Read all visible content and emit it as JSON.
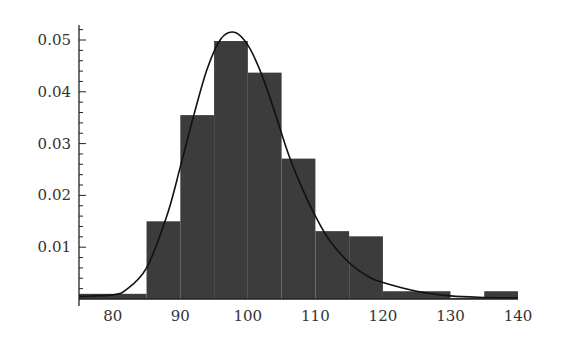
{
  "chart_data": {
    "type": "bar",
    "subtype": "histogram-with-density-curve",
    "title": "",
    "xlabel": "",
    "ylabel": "",
    "xlim": [
      75,
      140
    ],
    "ylim": [
      0,
      0.052
    ],
    "x_ticks": [
      80,
      90,
      100,
      110,
      120,
      130,
      140
    ],
    "x_tick_labels": [
      "80",
      "90",
      "100",
      "110",
      "120",
      "130",
      "140"
    ],
    "y_ticks": [
      0.01,
      0.02,
      0.03,
      0.04,
      0.05
    ],
    "y_tick_labels": [
      "0.01",
      "0.02",
      "0.03",
      "0.04",
      "0.05"
    ],
    "grid": false,
    "legend": null,
    "bins": [
      {
        "from": 75,
        "to": 85,
        "density": 0.001
      },
      {
        "from": 85,
        "to": 90,
        "density": 0.015
      },
      {
        "from": 90,
        "to": 95,
        "density": 0.0355
      },
      {
        "from": 95,
        "to": 100,
        "density": 0.0498
      },
      {
        "from": 100,
        "to": 105,
        "density": 0.0437
      },
      {
        "from": 105,
        "to": 110,
        "density": 0.0271
      },
      {
        "from": 110,
        "to": 115,
        "density": 0.0131
      },
      {
        "from": 115,
        "to": 120,
        "density": 0.0121
      },
      {
        "from": 120,
        "to": 130,
        "density": 0.0015
      },
      {
        "from": 130,
        "to": 135,
        "density": 0.0002
      },
      {
        "from": 135,
        "to": 140,
        "density": 0.0015
      }
    ],
    "series": [
      {
        "name": "histogram",
        "type": "bar",
        "color": "#3c3c3c"
      },
      {
        "name": "density-curve",
        "type": "line",
        "color": "#111111",
        "x": [
          75,
          80,
          82,
          85,
          88,
          90,
          92,
          94,
          96,
          98,
          100,
          102,
          104,
          106,
          108,
          110,
          112,
          115,
          118,
          120,
          125,
          130,
          135,
          140
        ],
        "y": [
          0.0005,
          0.0008,
          0.0018,
          0.006,
          0.016,
          0.0255,
          0.0355,
          0.0445,
          0.0502,
          0.0515,
          0.049,
          0.0435,
          0.036,
          0.028,
          0.0215,
          0.016,
          0.0115,
          0.007,
          0.0042,
          0.0032,
          0.0015,
          0.0006,
          0.0003,
          0.0002
        ]
      }
    ]
  }
}
